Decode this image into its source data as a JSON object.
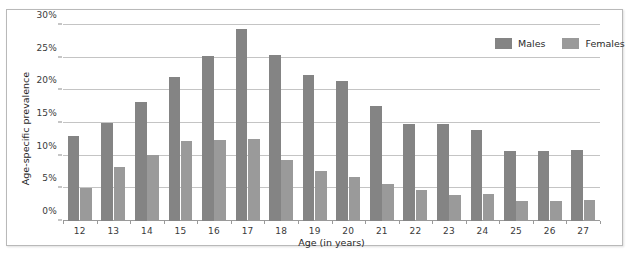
{
  "chart_data": {
    "type": "bar",
    "title": "",
    "xlabel": "Age (in years)",
    "ylabel": "Age-specific prevalence",
    "categories": [
      "12",
      "13",
      "14",
      "15",
      "16",
      "17",
      "18",
      "19",
      "20",
      "21",
      "22",
      "23",
      "24",
      "25",
      "26",
      "27"
    ],
    "series": [
      {
        "name": "Males",
        "color": "#848484",
        "values": [
          13.0,
          15.0,
          18.2,
          22.1,
          25.3,
          29.4,
          25.4,
          22.4,
          21.4,
          17.6,
          14.9,
          14.8,
          14.0,
          10.7,
          10.7,
          10.8
        ]
      },
      {
        "name": "Females",
        "color": "#9a9a9a",
        "values": [
          5.0,
          8.2,
          10.1,
          12.3,
          12.4,
          12.6,
          9.4,
          7.6,
          6.8,
          5.6,
          4.8,
          4.0,
          4.1,
          3.1,
          3.1,
          3.2
        ]
      }
    ],
    "ylim": [
      0,
      30
    ],
    "yticks": [
      0,
      5,
      10,
      15,
      20,
      25,
      30
    ],
    "ytick_labels": [
      "0%",
      "5%",
      "10%",
      "15%",
      "20%",
      "25%",
      "30%"
    ],
    "grid": true,
    "legend_position": "top-right"
  },
  "legend": {
    "items": [
      {
        "label": "Males"
      },
      {
        "label": "Females"
      }
    ]
  },
  "axes": {
    "y_title": "Age-specific prevalence",
    "x_title": "Age (in years)"
  }
}
